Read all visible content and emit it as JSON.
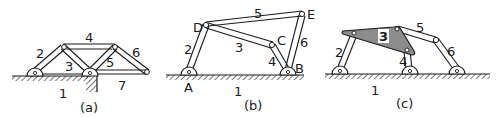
{
  "figure": {
    "colors": {
      "ink": "#1a1a1a",
      "background": "#ffffff",
      "shaded_link": "#8c8c8c"
    },
    "panels": [
      {
        "caption": "(a)",
        "link_labels": {
          "l1": "1",
          "l2": "2",
          "l3": "3",
          "l4": "4",
          "l5": "5",
          "l6": "6",
          "l7": "7"
        }
      },
      {
        "caption": "(b)",
        "link_labels": {
          "l1": "1",
          "l2": "2",
          "l3": "3",
          "l4": "4",
          "l5": "5",
          "l6": "6"
        },
        "joint_labels": {
          "A": "A",
          "B": "B",
          "C": "C",
          "D": "D",
          "E": "E"
        }
      },
      {
        "caption": "(c)",
        "link_labels": {
          "l1": "1",
          "l2": "2",
          "l3": "3",
          "l4": "4",
          "l5": "5",
          "l6": "6"
        }
      }
    ]
  }
}
